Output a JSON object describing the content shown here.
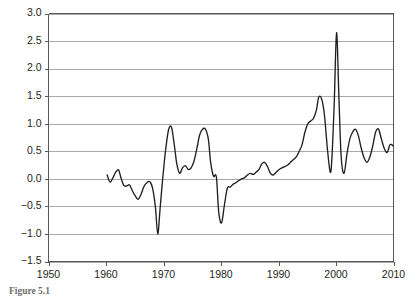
{
  "caption": {
    "text": "Figure 5.1"
  },
  "chart_data": {
    "type": "line",
    "title": "",
    "subtitle": "",
    "xlabel": "",
    "ylabel": "",
    "xlim": [
      1950,
      2010
    ],
    "ylim": [
      -1.5,
      3.0
    ],
    "grid": true,
    "grid_axis": "y",
    "legend": false,
    "legend_position": "none",
    "annotations": [],
    "yticks": [
      -1.5,
      -1.0,
      -0.5,
      0.0,
      0.5,
      1.0,
      1.5,
      2.0,
      2.5,
      3.0
    ],
    "ytick_labels": [
      "-1.5",
      "-1.0",
      "-0.5",
      "0.0",
      "0.5",
      "1.0",
      "1.5",
      "2.0",
      "2.5",
      "3.0"
    ],
    "xticks": [
      1950,
      1960,
      1970,
      1980,
      1990,
      2000,
      2010
    ],
    "xtick_labels": [
      "1950",
      "1960",
      "1970",
      "1980",
      "1990",
      "2000",
      "2010"
    ],
    "line_color": "#231f20",
    "grid_color": "#a7a9ac",
    "axis_color": "#58595b",
    "series": [
      {
        "name": "series-1",
        "x": [
          1960.2,
          1960.7,
          1961.2,
          1961.7,
          1962.2,
          1962.6,
          1963.1,
          1963.6,
          1964.1,
          1964.6,
          1965.1,
          1965.6,
          1966.1,
          1966.6,
          1967.1,
          1967.6,
          1968.1,
          1968.6,
          1969.0,
          1969.4,
          1969.9,
          1970.4,
          1970.9,
          1971.4,
          1971.9,
          1972.3,
          1972.8,
          1973.3,
          1973.8,
          1974.3,
          1974.8,
          1975.3,
          1975.8,
          1976.3,
          1976.8,
          1977.3,
          1977.8,
          1978.2,
          1978.7,
          1979.2,
          1979.6,
          1980.1,
          1980.6,
          1981.1,
          1981.6,
          1982.1,
          1982.6,
          1983.1,
          1983.6,
          1984.1,
          1984.6,
          1985.1,
          1985.6,
          1986.1,
          1986.6,
          1987.1,
          1987.6,
          1988.1,
          1988.6,
          1989.1,
          1989.6,
          1990.1,
          1990.6,
          1991.1,
          1991.6,
          1992.1,
          1992.6,
          1993.1,
          1993.6,
          1994.1,
          1994.6,
          1995.1,
          1995.6,
          1996.1,
          1996.6,
          1997.0,
          1997.5,
          1998.0,
          1998.5,
          1999.0,
          1999.3,
          1999.7,
          2000.1,
          2000.5,
          2000.9,
          2001.4,
          2001.9,
          2002.4,
          2002.9,
          2003.4,
          2003.9,
          2004.4,
          2004.9,
          2005.4,
          2005.9,
          2006.4,
          2006.9,
          2007.4,
          2007.9,
          2008.4,
          2008.9,
          2009.4,
          2009.9
        ],
        "y": [
          0.07,
          -0.06,
          0.02,
          0.12,
          0.16,
          0.02,
          -0.12,
          -0.13,
          -0.11,
          -0.22,
          -0.31,
          -0.37,
          -0.28,
          -0.14,
          -0.07,
          -0.05,
          -0.17,
          -0.52,
          -1.0,
          -0.55,
          0.05,
          0.55,
          0.9,
          0.93,
          0.6,
          0.28,
          0.1,
          0.2,
          0.24,
          0.17,
          0.2,
          0.32,
          0.55,
          0.8,
          0.9,
          0.9,
          0.72,
          0.3,
          0.05,
          0.03,
          -0.6,
          -0.8,
          -0.47,
          -0.17,
          -0.15,
          -0.1,
          -0.07,
          -0.03,
          0.0,
          0.02,
          0.07,
          0.1,
          0.08,
          0.12,
          0.17,
          0.27,
          0.3,
          0.22,
          0.1,
          0.07,
          0.12,
          0.17,
          0.2,
          0.22,
          0.25,
          0.3,
          0.35,
          0.4,
          0.5,
          0.62,
          0.85,
          1.0,
          1.05,
          1.1,
          1.25,
          1.48,
          1.45,
          1.15,
          0.55,
          0.12,
          0.4,
          1.4,
          2.65,
          1.5,
          0.4,
          0.1,
          0.45,
          0.72,
          0.85,
          0.9,
          0.78,
          0.55,
          0.38,
          0.3,
          0.4,
          0.6,
          0.85,
          0.9,
          0.72,
          0.55,
          0.48,
          0.62,
          0.6
        ]
      }
    ]
  }
}
